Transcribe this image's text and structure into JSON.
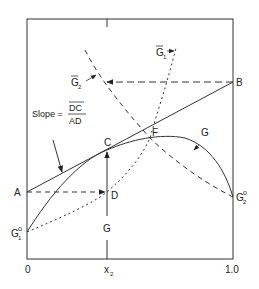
{
  "diagram": {
    "type": "thermodynamic-tangent-intercept",
    "axis": {
      "x_min_label": "0",
      "x_max_label": "1.0",
      "x_var_label": "x",
      "x_var_sub": "2"
    },
    "points": {
      "A": "A",
      "B": "B",
      "C": "C",
      "D": "D",
      "F": "F"
    },
    "curves": {
      "G": "G",
      "G_vertical": "G",
      "G1bar": "G",
      "G1bar_sub": "1",
      "G2bar": "G",
      "G2bar_sub": "2",
      "G1o": "G",
      "G1o_sub": "1",
      "G1o_sup": "o",
      "G2o": "G",
      "G2o_sub": "2",
      "G2o_sup": "o"
    },
    "slope_label": {
      "prefix": "Slope =",
      "numerator": "DC",
      "denominator": "AD"
    },
    "colors": {
      "line": "#333333",
      "background": "#ffffff"
    }
  }
}
